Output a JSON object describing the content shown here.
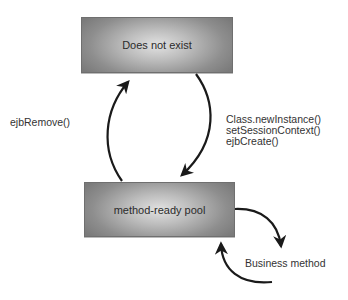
{
  "diagram": {
    "type": "state-diagram",
    "states": [
      {
        "id": "does-not-exist",
        "label": "Does not exist"
      },
      {
        "id": "method-ready-pool",
        "label": "method-ready pool"
      }
    ],
    "transitions": [
      {
        "from": "does-not-exist",
        "to": "method-ready-pool",
        "labels": [
          "Class.newInstance()",
          "setSessionContext()",
          "ejbCreate()"
        ]
      },
      {
        "from": "method-ready-pool",
        "to": "does-not-exist",
        "labels": [
          "ejbRemove()"
        ]
      },
      {
        "from": "method-ready-pool",
        "to": "method-ready-pool",
        "labels": [
          "Business method"
        ]
      }
    ]
  },
  "labels": {
    "top_state": "Does not exist",
    "bottom_state": "method-ready pool",
    "remove": "ejbRemove()",
    "create_lines": [
      "Class.newInstance()",
      "setSessionContext()",
      "ejbCreate()"
    ],
    "business": "Business method"
  },
  "colors": {
    "box_border": "#6f6f6f",
    "box_center": "#e2e2e2",
    "box_edge": "#7a7a7a",
    "arrow": "#1a1a1a",
    "text": "#2b2b2b"
  }
}
